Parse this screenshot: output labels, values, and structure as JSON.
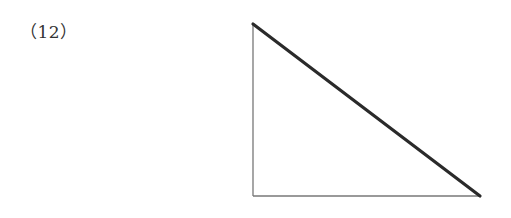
{
  "problem": {
    "number_label": "（12）"
  },
  "figure": {
    "shape": "right-triangle",
    "vertices": {
      "top_left": [
        253,
        24
      ],
      "bottom_left": [
        253,
        196
      ],
      "bottom_right": [
        480,
        196
      ]
    },
    "emphasized_side": "hypotenuse",
    "colors": {
      "thin_line": "#777777",
      "thick_line": "#2a2a2a"
    }
  }
}
